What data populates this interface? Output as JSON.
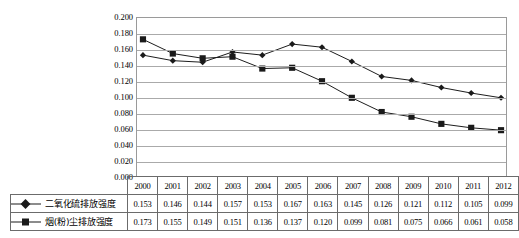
{
  "chart_data": {
    "type": "line",
    "title": "",
    "subtitle": "",
    "xlabel": "",
    "ylabel": "",
    "ylim": [
      0.0,
      0.2
    ],
    "ytick_step": 0.02,
    "grid": true,
    "legend_position": "table-row-headers",
    "categories": [
      "2000",
      "2001",
      "2002",
      "2003",
      "2004",
      "2005",
      "2006",
      "2007",
      "2008",
      "2009",
      "2010",
      "2011",
      "2012"
    ],
    "yticks": [
      "0.000",
      "0.020",
      "0.040",
      "0.060",
      "0.080",
      "0.100",
      "0.120",
      "0.140",
      "0.160",
      "0.180",
      "0.200"
    ],
    "series": [
      {
        "name": "二氧化硫排放强度",
        "marker": "diamond",
        "color": "#1a1a1a",
        "values": [
          0.153,
          0.146,
          0.144,
          0.157,
          0.153,
          0.167,
          0.163,
          0.145,
          0.126,
          0.121,
          0.112,
          0.105,
          0.099
        ],
        "labels": [
          "0.153",
          "0.146",
          "0.144",
          "0.157",
          "0.153",
          "0.167",
          "0.163",
          "0.145",
          "0.126",
          "0.121",
          "0.112",
          "0.105",
          "0.099"
        ]
      },
      {
        "name": "烟(粉)尘排放强度",
        "marker": "square",
        "color": "#1a1a1a",
        "values": [
          0.173,
          0.155,
          0.149,
          0.151,
          0.136,
          0.137,
          0.12,
          0.099,
          0.081,
          0.075,
          0.066,
          0.061,
          0.058
        ],
        "labels": [
          "0.173",
          "0.155",
          "0.149",
          "0.151",
          "0.136",
          "0.137",
          "0.120",
          "0.099",
          "0.081",
          "0.075",
          "0.066",
          "0.061",
          "0.058"
        ]
      }
    ]
  },
  "table": {
    "corner_label": "",
    "year_header": [
      "2000",
      "2001",
      "2002",
      "2003",
      "2004",
      "2005",
      "2006",
      "2007",
      "2008",
      "2009",
      "2010",
      "2011",
      "2012"
    ],
    "rows": [
      {
        "legend_label": "二氧化硫排放强度",
        "marker": "diamond",
        "values": [
          "0.153",
          "0.146",
          "0.144",
          "0.157",
          "0.153",
          "0.167",
          "0.163",
          "0.145",
          "0.126",
          "0.121",
          "0.112",
          "0.105",
          "0.099"
        ]
      },
      {
        "legend_label": "烟(粉)尘排放强度",
        "marker": "square",
        "values": [
          "0.173",
          "0.155",
          "0.149",
          "0.151",
          "0.136",
          "0.137",
          "0.120",
          "0.099",
          "0.081",
          "0.075",
          "0.066",
          "0.061",
          "0.058"
        ]
      }
    ]
  },
  "colors": {
    "series_line": "#1a1a1a",
    "gridline": "#aaaaaa",
    "plot_border": "#9a9a9a",
    "table_border": "#6b6b6b",
    "background": "#ffffff"
  }
}
